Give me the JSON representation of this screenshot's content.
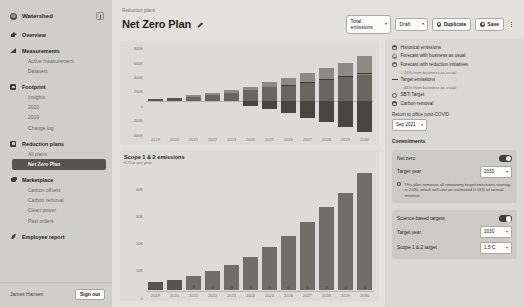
{
  "sidebar": {
    "brand": "Watershed",
    "collapse_icon": "panel-collapse-icon",
    "groups": [
      {
        "label": "Overview",
        "icon": "home-icon",
        "items": []
      },
      {
        "label": "Measurements",
        "icon": "chart-icon",
        "items": [
          {
            "label": "Active measurement",
            "active": false
          },
          {
            "label": "Datasets",
            "active": false
          }
        ]
      },
      {
        "label": "Footprint",
        "icon": "footprint-icon",
        "items": [
          {
            "label": "Insights",
            "active": false
          },
          {
            "label": "2020",
            "active": false
          },
          {
            "label": "2019",
            "active": false
          },
          {
            "label": "Change log",
            "active": false
          }
        ]
      },
      {
        "label": "Reduction plans",
        "icon": "reduction-icon",
        "items": [
          {
            "label": "All plans",
            "active": false
          },
          {
            "label": "Net Zero Plan",
            "active": true
          }
        ]
      },
      {
        "label": "Marketplace",
        "icon": "cart-icon",
        "items": [
          {
            "label": "Carbon offsets",
            "active": false
          },
          {
            "label": "Carbon removal",
            "active": false
          },
          {
            "label": "Clean power",
            "active": false
          },
          {
            "label": "Past orders",
            "active": false
          }
        ]
      },
      {
        "label": "Employee report",
        "icon": "leaf-icon",
        "items": []
      }
    ],
    "user_name": "James Hansen",
    "sign_out": "Sign out"
  },
  "header": {
    "breadcrumb": "Reduction plans",
    "title": "Net Zero Plan",
    "edit_icon": "pencil-icon",
    "metric_select": "Total emissions",
    "status_select": "Draft",
    "duplicate_label": "Duplicate",
    "save_label": "Save",
    "overflow_icon": "kebab-menu-icon"
  },
  "legend": {
    "items": [
      {
        "label": "Historical emissions",
        "swatch": "dot",
        "color": "#4f4f4a",
        "sub": null
      },
      {
        "label": "Forecast with business as usual",
        "swatch": "dot",
        "color": "#7c7b76",
        "sub": null
      },
      {
        "label": "Forecast with reduction initiatives",
        "swatch": "dot",
        "color": "#5c5b56",
        "sub": "↓ 24% from business as usual"
      },
      {
        "label": "Target emissions",
        "swatch": "line",
        "color": "#3c3c38",
        "sub": "↓ 45% from business as usual"
      },
      {
        "label": "SBTi Target",
        "swatch": "hollow",
        "color": "#55554f",
        "sub": null
      },
      {
        "label": "Carbon removal",
        "swatch": "dot",
        "color": "#45453f",
        "sub": null
      }
    ],
    "return_office_label": "Return to office post-COVID",
    "return_office_value": "Sep 2021"
  },
  "commitments": {
    "section_title": "Commitments",
    "net_zero_label": "Net zero",
    "net_zero_on": true,
    "net_zero_target_year_label": "Target year",
    "net_zero_target_year": "2030",
    "note": "This plan removes all remaining target emissions starting in 2030, which will cost an estimated 0.03% of annual revenue.",
    "sbt_label": "Science-based targets",
    "sbt_on": true,
    "sbt_target_year_label": "Target year",
    "sbt_target_year": "2030",
    "sbt_scope_label": "Scope 1 & 2 target",
    "sbt_scope_value": "1.5ºC"
  },
  "chart_data": [
    {
      "id": "total-emissions",
      "type": "bar",
      "stacked": true,
      "title": "",
      "xlabel": "",
      "ylabel": "",
      "ylim": [
        -500000,
        850000
      ],
      "yticks": [
        800000,
        600000,
        400000,
        200000,
        0,
        -200000,
        -400000
      ],
      "ytick_labels": [
        "800K",
        "600K",
        "400K",
        "200K",
        "0",
        "-200K",
        "-400K"
      ],
      "categories": [
        "2019",
        "2020",
        "2021",
        "2022",
        "2023",
        "2024",
        "2025",
        "2026",
        "2027",
        "2028",
        "2029",
        "2030"
      ],
      "series": [
        {
          "name": "Historical emissions",
          "color": "#55544f",
          "values": [
            42000,
            52000,
            0,
            0,
            0,
            0,
            0,
            0,
            0,
            0,
            0,
            0
          ]
        },
        {
          "name": "Forecast with reduction initiatives",
          "color": "#67665f",
          "values": [
            0,
            0,
            74000,
            104000,
            128000,
            166000,
            214000,
            252000,
            296000,
            330000,
            366000,
            402000
          ]
        },
        {
          "name": "Forecast with business as usual",
          "color": "#8b8a83",
          "values": [
            0,
            0,
            16000,
            26000,
            38000,
            54000,
            74000,
            96000,
            126000,
            166000,
            216000,
            284000
          ]
        },
        {
          "name": "Carbon removal",
          "color": "#464540",
          "values": [
            0,
            0,
            0,
            0,
            0,
            -66000,
            -112000,
            -178000,
            -242000,
            -304000,
            -386000,
            -452000
          ]
        }
      ],
      "target_line": {
        "name": "Target emissions",
        "color": "#3c3c38",
        "values": [
          null,
          null,
          null,
          null,
          null,
          null,
          null,
          250000,
          292000,
          334000,
          386000,
          430000
        ]
      }
    },
    {
      "id": "scope-1-2",
      "type": "bar",
      "title": "Scope 1 & 2 emissions",
      "subtitle": "tCO₂e per year",
      "ylim": [
        0,
        48000
      ],
      "yticks": [
        40000,
        30000,
        20000,
        10000,
        0
      ],
      "ytick_labels": [
        "40K",
        "30K",
        "20K",
        "10K",
        "0"
      ],
      "categories": [
        "2019",
        "2020",
        "2021",
        "2022",
        "2023",
        "2024",
        "2025",
        "2026",
        "2027",
        "2028",
        "2029",
        "2030"
      ],
      "values": [
        3200,
        4100,
        5600,
        7600,
        10000,
        13200,
        16800,
        21200,
        26600,
        32400,
        38000,
        45600
      ],
      "markers": [
        null,
        null,
        2800,
        2600,
        2500,
        2500,
        2500,
        2500,
        2500,
        2500,
        2500,
        2500
      ],
      "marker_label": "sbti-target-marker"
    }
  ]
}
